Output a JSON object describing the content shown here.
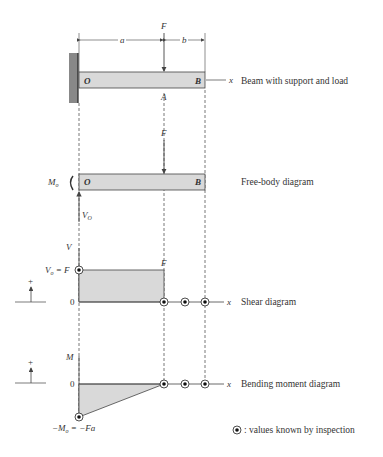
{
  "colors": {
    "stroke": "#444444",
    "fill": "#d9d9d9",
    "wall": "#888888",
    "text": "#333333"
  },
  "beam": {
    "caption": "Beam with support and load",
    "label_O": "O",
    "label_B": "B",
    "label_A": "A",
    "label_F": "F",
    "dim_a": "a",
    "dim_b": "b",
    "axis_x": "x"
  },
  "fbd": {
    "caption": "Free-body diagram",
    "label_O": "O",
    "label_B": "B",
    "label_F": "F",
    "label_Mo": "M",
    "label_Mo_sub": "o",
    "label_Vo": "V",
    "label_Vo_sub": "O"
  },
  "shear": {
    "caption": "Shear diagram",
    "axis_v": "V",
    "axis_x": "x",
    "zero": "0",
    "label_vo": "V",
    "label_vo_sub": "o",
    "label_vo_rhs": " = F",
    "label_F": "F",
    "sign_plus": "+"
  },
  "moment": {
    "caption": "Bending moment diagram",
    "axis_m": "M",
    "axis_x": "x",
    "zero": "0",
    "label_mo": "−M",
    "label_mo_sub": "o",
    "label_mo_rhs": " = −Fa",
    "sign_plus": "+"
  },
  "legend": {
    "text": ": values known by inspection",
    "icon": "circled-dot-icon"
  }
}
